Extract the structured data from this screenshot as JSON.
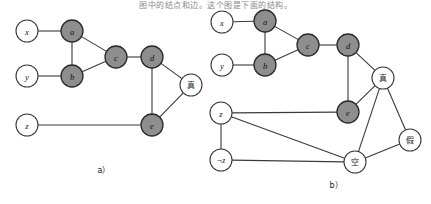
{
  "figure": {
    "top_text": "图中的结点和边。这个图是下面的结构。",
    "captions": {
      "left": "a）",
      "right": "b）"
    }
  },
  "colors": {
    "shaded_fill": "#8e8e8e",
    "open_fill": "#ffffff",
    "stroke": "#3a3a3a",
    "text": "#1a1a1a"
  },
  "graph_a": {
    "name": "constraint-graph-a",
    "nodes": [
      {
        "id": "x",
        "label": "x",
        "x": 27,
        "y": 31,
        "r": 11,
        "style": "open"
      },
      {
        "id": "a",
        "label": "a",
        "x": 72,
        "y": 31,
        "r": 11,
        "style": "shaded"
      },
      {
        "id": "y",
        "label": "y",
        "x": 27,
        "y": 76,
        "r": 11,
        "style": "open"
      },
      {
        "id": "b",
        "label": "b",
        "x": 72,
        "y": 76,
        "r": 11,
        "style": "shaded"
      },
      {
        "id": "c",
        "label": "c",
        "x": 116,
        "y": 57,
        "r": 11,
        "style": "shaded"
      },
      {
        "id": "d",
        "label": "d",
        "x": 152,
        "y": 57,
        "r": 11,
        "style": "shaded"
      },
      {
        "id": "zhen",
        "label": "真",
        "x": 191,
        "y": 85,
        "r": 11,
        "style": "open"
      },
      {
        "id": "z",
        "label": "z",
        "x": 27,
        "y": 125,
        "r": 11,
        "style": "open"
      },
      {
        "id": "e",
        "label": "e",
        "x": 152,
        "y": 125,
        "r": 11,
        "style": "shaded"
      }
    ],
    "edges": [
      [
        "x",
        "a"
      ],
      [
        "y",
        "b"
      ],
      [
        "a",
        "b"
      ],
      [
        "a",
        "c"
      ],
      [
        "b",
        "c"
      ],
      [
        "c",
        "d"
      ],
      [
        "d",
        "zhen"
      ],
      [
        "d",
        "e"
      ],
      [
        "e",
        "zhen"
      ],
      [
        "z",
        "e"
      ]
    ]
  },
  "graph_b": {
    "name": "constraint-graph-b",
    "nodes": [
      {
        "id": "x",
        "label": "x",
        "x": 222,
        "y": 22,
        "r": 11,
        "style": "open"
      },
      {
        "id": "a",
        "label": "a",
        "x": 265,
        "y": 21,
        "r": 11,
        "style": "shaded"
      },
      {
        "id": "y",
        "label": "y",
        "x": 222,
        "y": 65,
        "r": 11,
        "style": "open"
      },
      {
        "id": "b",
        "label": "b",
        "x": 265,
        "y": 65,
        "r": 11,
        "style": "shaded"
      },
      {
        "id": "c",
        "label": "c",
        "x": 308,
        "y": 45,
        "r": 11,
        "style": "shaded"
      },
      {
        "id": "d",
        "label": "d",
        "x": 348,
        "y": 45,
        "r": 11,
        "style": "shaded"
      },
      {
        "id": "zhen",
        "label": "真",
        "x": 383,
        "y": 78,
        "r": 11,
        "style": "open"
      },
      {
        "id": "e",
        "label": "e",
        "x": 348,
        "y": 112,
        "r": 11,
        "style": "shaded"
      },
      {
        "id": "jia",
        "label": "假",
        "x": 410,
        "y": 140,
        "r": 11,
        "style": "open"
      },
      {
        "id": "kong",
        "label": "空",
        "x": 355,
        "y": 162,
        "r": 11,
        "style": "open"
      },
      {
        "id": "z",
        "label": "z",
        "x": 221,
        "y": 113,
        "r": 11,
        "style": "open"
      },
      {
        "id": "nz",
        "label": "¬z",
        "x": 221,
        "y": 160,
        "r": 11,
        "style": "open"
      }
    ],
    "edges": [
      [
        "x",
        "a"
      ],
      [
        "y",
        "b"
      ],
      [
        "a",
        "b"
      ],
      [
        "a",
        "c"
      ],
      [
        "b",
        "c"
      ],
      [
        "c",
        "d"
      ],
      [
        "d",
        "zhen"
      ],
      [
        "d",
        "e"
      ],
      [
        "e",
        "zhen"
      ],
      [
        "zhen",
        "jia"
      ],
      [
        "zhen",
        "kong"
      ],
      [
        "jia",
        "kong"
      ],
      [
        "z",
        "e"
      ],
      [
        "z",
        "nz"
      ],
      [
        "z",
        "kong"
      ],
      [
        "nz",
        "kong"
      ]
    ]
  }
}
